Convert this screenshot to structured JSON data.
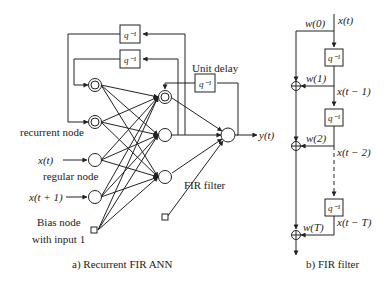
{
  "left_panel": {
    "caption": "a) Recurrent FIR ANN",
    "labels": {
      "recurrent_node": "recurrent node",
      "regular_node": "regular node",
      "bias_node_line1": "Bias node",
      "bias_node_line2": "with input 1",
      "unit_delay": "Unit delay",
      "fir_filter": "FIR filter",
      "input_x_t": "x(t)",
      "input_x_t1": "x(t + 1)",
      "output_y": "y(t)"
    },
    "delay_boxes": [
      "q⁻¹",
      "q⁻¹",
      "q⁻¹"
    ]
  },
  "right_panel": {
    "caption": "b) FIR filter",
    "signals": [
      "x(t)",
      "x(t − 1)",
      "x(t − 2)",
      "x(t − T)"
    ],
    "weights": [
      "w(0)",
      "w(1)",
      "w(2)",
      "w(T)"
    ],
    "delay_boxes": [
      "q⁻¹",
      "q⁻¹",
      "q⁻¹"
    ],
    "adder_symbol": "⊕"
  }
}
